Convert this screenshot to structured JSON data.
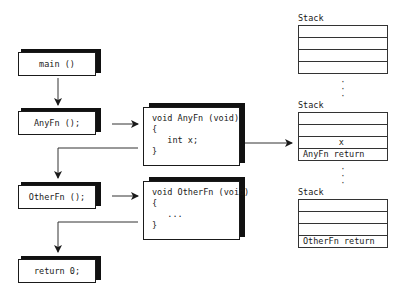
{
  "calls": [
    {
      "id": "main",
      "label": "main ()"
    },
    {
      "id": "anyfn-call",
      "label": "AnyFn ();"
    },
    {
      "id": "otherfn-call",
      "label": "OtherFn ();"
    },
    {
      "id": "return",
      "label": "return 0;"
    }
  ],
  "functions": {
    "anyfn": {
      "lines": [
        "void AnyFn (void)",
        "{",
        "   int x;",
        "}"
      ]
    },
    "otherfn": {
      "lines": [
        "void OtherFn (void)",
        "{",
        "   ...",
        "}"
      ]
    }
  },
  "stacks": [
    {
      "label": "Stack",
      "rows": [
        "",
        "",
        "",
        ""
      ]
    },
    {
      "label": "Stack",
      "rows": [
        "",
        "",
        "       x",
        "AnyFn return"
      ]
    },
    {
      "label": "Stack",
      "rows": [
        "",
        "",
        "",
        "OtherFn return"
      ]
    }
  ],
  "ellipsis": ":"
}
